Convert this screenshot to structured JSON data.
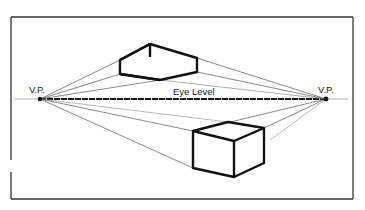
{
  "diagram": {
    "labels": {
      "left_vp": "V.P.",
      "right_vp": "V.P.",
      "eye_level": "Eye Level"
    },
    "colors": {
      "background": "#ffffff",
      "ink": "#1a1a1a",
      "guide": "#555555",
      "frame": "#333333"
    },
    "vanishing_points": [
      {
        "name": "left",
        "x": 40,
        "y": 99
      },
      {
        "name": "right",
        "x": 326,
        "y": 99
      }
    ],
    "eye_level_y": 99,
    "boxes": [
      {
        "name": "upper-box",
        "position": "above eye level"
      },
      {
        "name": "lower-box",
        "position": "below eye level"
      }
    ]
  }
}
